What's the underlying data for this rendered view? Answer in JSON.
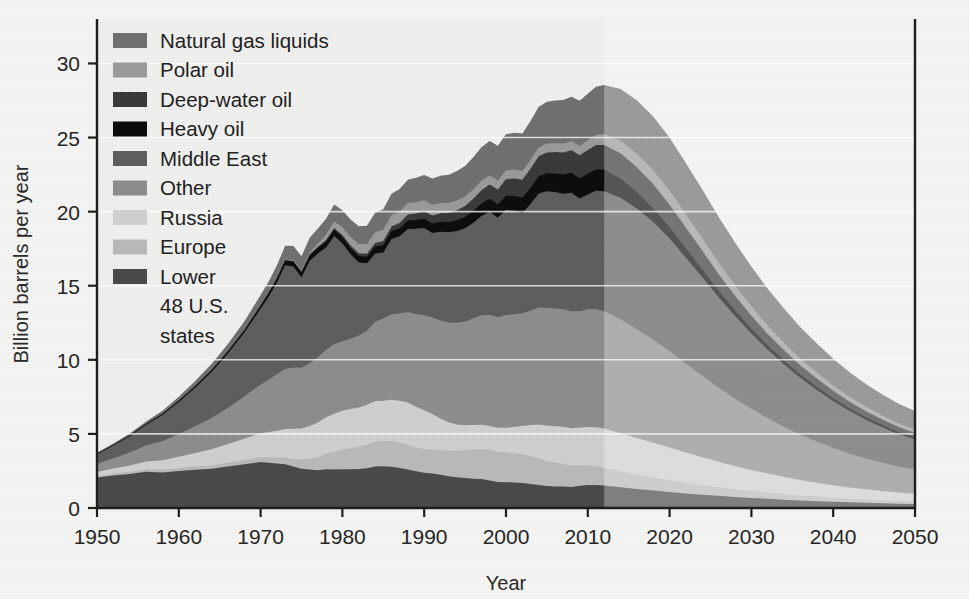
{
  "chart_data": {
    "type": "area",
    "stacked": true,
    "title": "",
    "xlabel": "Year",
    "ylabel": "Billion barrels per year",
    "xlim": [
      1950,
      2050
    ],
    "ylim": [
      0,
      33
    ],
    "xticks": [
      1950,
      1960,
      1970,
      1980,
      1990,
      2000,
      2010,
      2020,
      2030,
      2040,
      2050
    ],
    "yticks": [
      0,
      5,
      10,
      15,
      20,
      25,
      30
    ],
    "grid": "horizontal-light",
    "legend_position": "top-left-inside",
    "forecast_start_year": 2012,
    "forecast_shading": "light grey overlay right of 2012",
    "stack_order_bottom_to_top": [
      "Lower 48 U.S. states",
      "Europe",
      "Russia",
      "Other",
      "Middle East",
      "Heavy oil",
      "Deep-water oil",
      "Polar oil",
      "Natural gas liquids"
    ],
    "x": [
      1950,
      1952,
      1954,
      1956,
      1958,
      1960,
      1962,
      1964,
      1966,
      1968,
      1970,
      1971,
      1972,
      1973,
      1974,
      1975,
      1976,
      1977,
      1978,
      1979,
      1980,
      1981,
      1982,
      1983,
      1984,
      1985,
      1986,
      1987,
      1988,
      1989,
      1990,
      1991,
      1992,
      1993,
      1994,
      1995,
      1996,
      1997,
      1998,
      1999,
      2000,
      2001,
      2002,
      2003,
      2004,
      2005,
      2006,
      2007,
      2008,
      2009,
      2010,
      2011,
      2012,
      2014,
      2016,
      2018,
      2020,
      2022,
      2024,
      2026,
      2028,
      2030,
      2032,
      2034,
      2036,
      2038,
      2040,
      2042,
      2044,
      2046,
      2048,
      2050
    ],
    "series": [
      {
        "name": "Lower 48 U.S. states",
        "color": "#4a4a4a",
        "values": [
          2.05,
          2.2,
          2.3,
          2.45,
          2.4,
          2.5,
          2.58,
          2.65,
          2.8,
          2.95,
          3.1,
          3.05,
          3.0,
          2.95,
          2.8,
          2.65,
          2.6,
          2.55,
          2.62,
          2.6,
          2.62,
          2.62,
          2.63,
          2.68,
          2.8,
          2.82,
          2.78,
          2.7,
          2.6,
          2.48,
          2.38,
          2.32,
          2.25,
          2.15,
          2.08,
          2.02,
          1.98,
          1.95,
          1.86,
          1.76,
          1.74,
          1.72,
          1.68,
          1.62,
          1.55,
          1.48,
          1.45,
          1.45,
          1.42,
          1.5,
          1.55,
          1.55,
          1.52,
          1.4,
          1.28,
          1.18,
          1.08,
          0.98,
          0.9,
          0.82,
          0.75,
          0.68,
          0.62,
          0.56,
          0.51,
          0.46,
          0.42,
          0.38,
          0.35,
          0.32,
          0.29,
          0.27
        ]
      },
      {
        "name": "Europe",
        "color": "#b9b9b9",
        "values": [
          0.1,
          0.12,
          0.14,
          0.16,
          0.18,
          0.2,
          0.22,
          0.24,
          0.26,
          0.28,
          0.32,
          0.36,
          0.4,
          0.46,
          0.52,
          0.6,
          0.72,
          0.88,
          1.05,
          1.2,
          1.32,
          1.42,
          1.5,
          1.58,
          1.68,
          1.72,
          1.74,
          1.72,
          1.68,
          1.6,
          1.6,
          1.62,
          1.66,
          1.72,
          1.8,
          1.88,
          1.98,
          2.04,
          2.08,
          2.06,
          2.02,
          1.98,
          1.94,
          1.88,
          1.8,
          1.7,
          1.6,
          1.52,
          1.44,
          1.38,
          1.32,
          1.26,
          1.2,
          1.08,
          0.98,
          0.88,
          0.8,
          0.72,
          0.65,
          0.58,
          0.52,
          0.47,
          0.42,
          0.38,
          0.34,
          0.31,
          0.28,
          0.25,
          0.23,
          0.21,
          0.19,
          0.18
        ]
      },
      {
        "name": "Russia",
        "color": "#cfcfcf",
        "values": [
          0.28,
          0.34,
          0.42,
          0.52,
          0.64,
          0.76,
          0.92,
          1.08,
          1.26,
          1.44,
          1.62,
          1.72,
          1.82,
          1.92,
          2.02,
          2.12,
          2.22,
          2.34,
          2.46,
          2.56,
          2.62,
          2.64,
          2.66,
          2.7,
          2.74,
          2.7,
          2.78,
          2.82,
          2.84,
          2.76,
          2.62,
          2.4,
          2.12,
          1.92,
          1.76,
          1.68,
          1.64,
          1.62,
          1.6,
          1.6,
          1.66,
          1.76,
          1.92,
          2.1,
          2.28,
          2.38,
          2.46,
          2.52,
          2.52,
          2.56,
          2.6,
          2.64,
          2.64,
          2.56,
          2.46,
          2.34,
          2.2,
          2.04,
          1.88,
          1.72,
          1.56,
          1.42,
          1.28,
          1.16,
          1.04,
          0.94,
          0.84,
          0.76,
          0.68,
          0.62,
          0.56,
          0.52
        ]
      },
      {
        "name": "Other",
        "color": "#8d8d8d",
        "values": [
          0.55,
          0.7,
          0.88,
          1.08,
          1.3,
          1.54,
          1.8,
          2.1,
          2.45,
          2.85,
          3.3,
          3.55,
          3.8,
          4.05,
          4.15,
          4.1,
          4.25,
          4.4,
          4.55,
          4.7,
          4.7,
          4.75,
          4.85,
          5.0,
          5.35,
          5.55,
          5.75,
          5.9,
          6.1,
          6.25,
          6.4,
          6.52,
          6.62,
          6.72,
          6.86,
          7.0,
          7.2,
          7.4,
          7.5,
          7.46,
          7.6,
          7.62,
          7.6,
          7.72,
          7.9,
          7.96,
          7.96,
          7.92,
          7.9,
          7.84,
          7.94,
          7.96,
          7.92,
          7.7,
          7.35,
          6.95,
          6.5,
          6.0,
          5.5,
          5.0,
          4.55,
          4.12,
          3.74,
          3.38,
          3.06,
          2.78,
          2.52,
          2.28,
          2.08,
          1.9,
          1.74,
          1.62
        ]
      },
      {
        "name": "Middle East",
        "color": "#5e5e5e",
        "values": [
          0.65,
          0.85,
          1.1,
          1.4,
          1.75,
          2.15,
          2.6,
          3.1,
          3.65,
          4.3,
          5.1,
          5.6,
          6.2,
          7.0,
          6.8,
          6.1,
          6.9,
          7.0,
          6.9,
          7.3,
          6.6,
          5.7,
          4.95,
          4.55,
          4.6,
          4.45,
          5.1,
          5.2,
          5.6,
          5.75,
          5.9,
          5.7,
          6.0,
          6.1,
          6.2,
          6.3,
          6.45,
          6.7,
          6.95,
          6.7,
          7.1,
          7.0,
          6.75,
          7.2,
          7.7,
          7.85,
          7.85,
          7.8,
          8.0,
          7.6,
          7.75,
          8.0,
          8.1,
          8.2,
          8.15,
          7.95,
          7.6,
          7.15,
          6.65,
          6.1,
          5.58,
          5.08,
          4.62,
          4.2,
          3.82,
          3.48,
          3.16,
          2.88,
          2.62,
          2.4,
          2.2,
          2.05
        ]
      },
      {
        "name": "Heavy oil",
        "color": "#0d0d0d",
        "values": [
          0.05,
          0.06,
          0.07,
          0.08,
          0.09,
          0.1,
          0.12,
          0.14,
          0.16,
          0.18,
          0.22,
          0.25,
          0.28,
          0.32,
          0.34,
          0.34,
          0.36,
          0.38,
          0.4,
          0.42,
          0.42,
          0.42,
          0.42,
          0.44,
          0.48,
          0.5,
          0.52,
          0.54,
          0.58,
          0.6,
          0.62,
          0.64,
          0.66,
          0.68,
          0.72,
          0.76,
          0.8,
          0.84,
          0.88,
          0.9,
          0.96,
          1.0,
          1.04,
          1.1,
          1.16,
          1.22,
          1.26,
          1.3,
          1.34,
          1.36,
          1.4,
          1.44,
          1.46,
          1.3,
          1.1,
          0.92,
          0.76,
          0.62,
          0.52,
          0.44,
          0.38,
          0.33,
          0.29,
          0.26,
          0.23,
          0.21,
          0.19,
          0.17,
          0.16,
          0.15,
          0.14,
          0.13
        ]
      },
      {
        "name": "Deep-water oil",
        "color": "#3a3a3a",
        "values": [
          0.0,
          0.0,
          0.0,
          0.0,
          0.0,
          0.0,
          0.0,
          0.0,
          0.0,
          0.0,
          0.01,
          0.01,
          0.02,
          0.03,
          0.04,
          0.05,
          0.06,
          0.08,
          0.1,
          0.12,
          0.14,
          0.16,
          0.18,
          0.2,
          0.24,
          0.28,
          0.32,
          0.36,
          0.4,
          0.44,
          0.5,
          0.54,
          0.58,
          0.62,
          0.68,
          0.74,
          0.82,
          0.9,
          0.96,
          1.02,
          1.1,
          1.16,
          1.22,
          1.28,
          1.34,
          1.4,
          1.44,
          1.48,
          1.52,
          1.56,
          1.6,
          1.64,
          1.66,
          1.7,
          1.68,
          1.62,
          1.52,
          1.4,
          1.26,
          1.12,
          0.99,
          0.88,
          0.78,
          0.7,
          0.62,
          0.56,
          0.5,
          0.45,
          0.41,
          0.37,
          0.34,
          0.31
        ]
      },
      {
        "name": "Polar oil",
        "color": "#9a9a9a",
        "values": [
          0.0,
          0.0,
          0.0,
          0.0,
          0.0,
          0.0,
          0.0,
          0.0,
          0.0,
          0.0,
          0.0,
          0.01,
          0.02,
          0.04,
          0.06,
          0.08,
          0.12,
          0.2,
          0.34,
          0.44,
          0.52,
          0.58,
          0.62,
          0.66,
          0.72,
          0.76,
          0.78,
          0.78,
          0.78,
          0.76,
          0.74,
          0.72,
          0.7,
          0.68,
          0.66,
          0.64,
          0.64,
          0.64,
          0.62,
          0.6,
          0.6,
          0.6,
          0.6,
          0.6,
          0.6,
          0.6,
          0.6,
          0.6,
          0.62,
          0.64,
          0.66,
          0.7,
          0.74,
          0.84,
          0.92,
          0.96,
          0.96,
          0.92,
          0.86,
          0.78,
          0.7,
          0.63,
          0.56,
          0.5,
          0.45,
          0.4,
          0.36,
          0.33,
          0.3,
          0.27,
          0.25,
          0.23
        ]
      },
      {
        "name": "Natural gas liquids",
        "color": "#707070",
        "values": [
          0.05,
          0.08,
          0.11,
          0.15,
          0.2,
          0.26,
          0.33,
          0.4,
          0.48,
          0.58,
          0.7,
          0.76,
          0.84,
          0.92,
          0.95,
          0.96,
          1.0,
          1.04,
          1.1,
          1.14,
          1.16,
          1.18,
          1.2,
          1.24,
          1.32,
          1.38,
          1.44,
          1.5,
          1.58,
          1.64,
          1.72,
          1.78,
          1.84,
          1.9,
          1.98,
          2.06,
          2.16,
          2.26,
          2.32,
          2.34,
          2.44,
          2.48,
          2.52,
          2.62,
          2.74,
          2.82,
          2.88,
          2.94,
          3.0,
          3.04,
          3.14,
          3.24,
          3.3,
          3.5,
          3.6,
          3.62,
          3.56,
          3.44,
          3.28,
          3.08,
          2.88,
          2.68,
          2.48,
          2.3,
          2.12,
          1.96,
          1.8,
          1.66,
          1.54,
          1.42,
          1.32,
          1.24
        ]
      }
    ]
  },
  "legend": {
    "items": [
      {
        "label": "Natural gas liquids",
        "color": "#707070"
      },
      {
        "label": "Polar oil",
        "color": "#9a9a9a"
      },
      {
        "label": "Deep-water oil",
        "color": "#3a3a3a"
      },
      {
        "label": "Heavy oil",
        "color": "#0d0d0d"
      },
      {
        "label": "Middle East",
        "color": "#5e5e5e"
      },
      {
        "label": "Other",
        "color": "#8d8d8d"
      },
      {
        "label": "Russia",
        "color": "#cfcfcf"
      },
      {
        "label": "Europe",
        "color": "#b9b9b9"
      },
      {
        "label": "Lower",
        "color": "#4a4a4a"
      }
    ],
    "last_item_continuation": [
      "48 U.S.",
      "states"
    ]
  },
  "axes": {
    "y_title": "Billion barrels per year",
    "x_title": "Year",
    "y_ticks": [
      "0",
      "5",
      "10",
      "15",
      "20",
      "25",
      "30"
    ],
    "x_ticks": [
      "1950",
      "1960",
      "1970",
      "1980",
      "1990",
      "2000",
      "2010",
      "2020",
      "2030",
      "2040",
      "2050"
    ]
  },
  "colors": {
    "background": "#f4f4f2",
    "frame": "#1e1e1e",
    "gridline": "#ffffff",
    "forecast_overlay": "rgba(255,255,255,0.30)"
  }
}
